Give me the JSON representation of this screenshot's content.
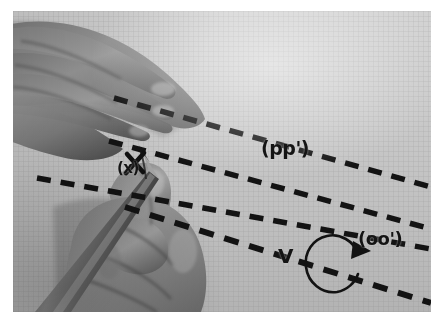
{
  "figure": {
    "type": "photograph",
    "medium": "grayscale photo",
    "background_color": "#c6c6c6",
    "border_color": "#ffffff",
    "ink_color": "#141414"
  },
  "annotations": {
    "pp_label": "(pp')",
    "oo_label": "(oo')",
    "v_label": "V",
    "x_label": "(x)",
    "x_mark": "✕"
  },
  "overlay": {
    "dashed_line_count": 4,
    "rotation_arrow": "counterclockwise-circular-arrow",
    "cross_mark": "x-mark-at-pencil-tip"
  },
  "scene": {
    "upper_hand": "left hand, four fingers spread, upper-left",
    "lower_hand": "right hand gripping a pencil, lower-left",
    "pencil": "pencil angled down-left with tip at the x mark",
    "surface": "fine-grid graph paper sheet"
  }
}
